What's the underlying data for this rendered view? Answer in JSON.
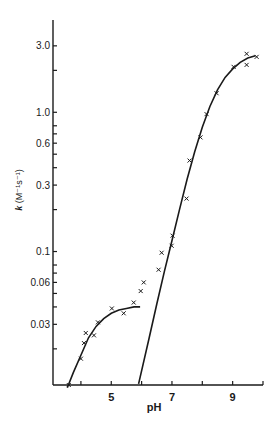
{
  "chart_data": {
    "type": "scatter",
    "title": "",
    "xlabel": "pH",
    "ylabel": "k (M⁻¹s⁻¹)",
    "xlim": [
      3.08,
      10.0
    ],
    "ylim": [
      0.011,
      4.6
    ],
    "yscale": "log",
    "grid": false,
    "x_ticks": [
      4,
      5,
      6,
      7,
      8,
      9,
      10
    ],
    "x_tick_labels": [
      "",
      "5",
      "",
      "7",
      "",
      "9",
      ""
    ],
    "y_ticks": [
      3.0,
      2.0,
      1.0,
      0.8,
      0.7,
      0.6,
      0.5,
      0.4,
      0.3,
      0.2,
      0.1,
      0.08,
      0.07,
      0.06,
      0.05,
      0.04,
      0.03,
      0.02
    ],
    "y_tick_labels": [
      {
        "value": 3.0,
        "label": "3.0"
      },
      {
        "value": 1.0,
        "label": "1.0"
      },
      {
        "value": 0.6,
        "label": "0.6"
      },
      {
        "value": 0.3,
        "label": "0.3"
      },
      {
        "value": 0.1,
        "label": "0.1"
      },
      {
        "value": 0.06,
        "label": "0.06"
      },
      {
        "value": 0.03,
        "label": "0.03"
      }
    ],
    "series": [
      {
        "name": "data points",
        "marker": "x",
        "points": [
          [
            3.6,
            0.011
          ],
          [
            4.0,
            0.017
          ],
          [
            4.1,
            0.022
          ],
          [
            4.16,
            0.026
          ],
          [
            4.43,
            0.025
          ],
          [
            4.56,
            0.031
          ],
          [
            5.02,
            0.039
          ],
          [
            5.41,
            0.036
          ],
          [
            5.74,
            0.043
          ],
          [
            5.97,
            0.052
          ],
          [
            6.07,
            0.06
          ],
          [
            6.56,
            0.074
          ],
          [
            6.66,
            0.098
          ],
          [
            6.99,
            0.11
          ],
          [
            7.02,
            0.13
          ],
          [
            7.48,
            0.24
          ],
          [
            7.58,
            0.45
          ],
          [
            7.94,
            0.66
          ],
          [
            8.14,
            0.97
          ],
          [
            8.47,
            1.37
          ],
          [
            9.03,
            2.12
          ],
          [
            9.46,
            2.19
          ],
          [
            9.46,
            2.63
          ],
          [
            9.79,
            2.5
          ]
        ]
      },
      {
        "name": "fit curve (low pH)",
        "marker": "line",
        "points": [
          [
            3.55,
            0.0105
          ],
          [
            3.75,
            0.0135
          ],
          [
            4.0,
            0.018
          ],
          [
            4.25,
            0.024
          ],
          [
            4.5,
            0.029
          ],
          [
            4.75,
            0.033
          ],
          [
            5.0,
            0.036
          ],
          [
            5.25,
            0.038
          ],
          [
            5.5,
            0.039
          ],
          [
            5.75,
            0.04
          ],
          [
            5.95,
            0.04
          ]
        ]
      },
      {
        "name": "fit curve (high pH)",
        "marker": "line",
        "points": [
          [
            5.9,
            0.0112
          ],
          [
            6.25,
            0.024
          ],
          [
            6.5,
            0.042
          ],
          [
            6.75,
            0.072
          ],
          [
            7.0,
            0.12
          ],
          [
            7.25,
            0.2
          ],
          [
            7.5,
            0.33
          ],
          [
            7.75,
            0.52
          ],
          [
            8.0,
            0.78
          ],
          [
            8.25,
            1.1
          ],
          [
            8.5,
            1.45
          ],
          [
            8.75,
            1.78
          ],
          [
            9.0,
            2.05
          ],
          [
            9.25,
            2.28
          ],
          [
            9.5,
            2.45
          ],
          [
            9.75,
            2.55
          ]
        ]
      }
    ]
  }
}
